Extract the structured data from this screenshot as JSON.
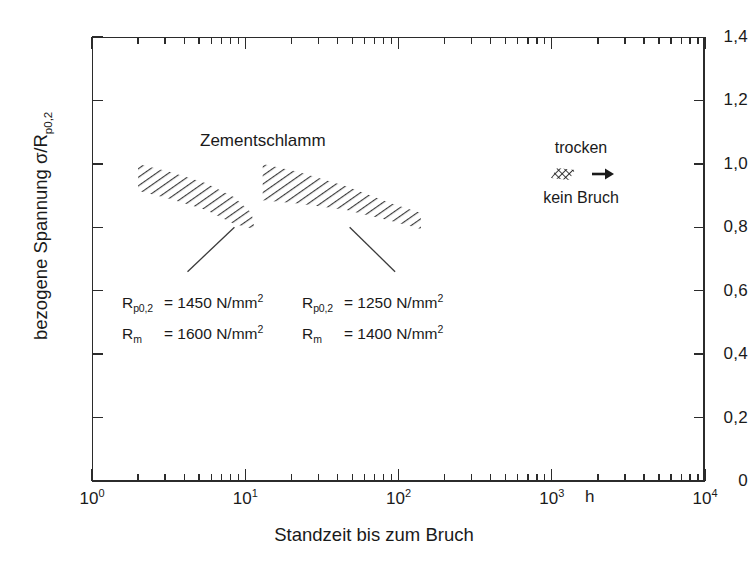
{
  "chart_data": {
    "type": "area",
    "title": "",
    "xlabel": "Standzeit bis zum Bruch",
    "ylabel": "bezogene Spannung σ/Rp0,2",
    "x_unit": "h",
    "x_scale": "log",
    "xlim": [
      1,
      10000
    ],
    "ylim": [
      0,
      1.4
    ],
    "y_scale": "linear",
    "grid": false,
    "x_tick_labels": [
      "10⁰",
      "10¹",
      "10²",
      "10³",
      "10⁴"
    ],
    "x_tick_values": [
      1,
      10,
      100,
      1000,
      10000
    ],
    "y_tick_labels": [
      "0",
      "0,2",
      "0,4",
      "0,6",
      "0,8",
      "1,0",
      "1,2",
      "1,4"
    ],
    "y_tick_values": [
      0,
      0.2,
      0.4,
      0.6,
      0.8,
      1.0,
      1.2,
      1.4
    ],
    "series": [
      {
        "name": "Zementschlamm, Rp0,2 = 1450 N/mm²",
        "type": "scatter-band",
        "upper": [
          [
            2.0,
            1.0
          ],
          [
            3.2,
            0.975
          ],
          [
            5.5,
            0.94
          ],
          [
            8.5,
            0.895
          ],
          [
            11.0,
            0.845
          ]
        ],
        "lower": [
          [
            2.0,
            0.915
          ],
          [
            3.2,
            0.89
          ],
          [
            5.5,
            0.855
          ],
          [
            8.5,
            0.81
          ],
          [
            11.5,
            0.795
          ]
        ]
      },
      {
        "name": "Zementschlamm, Rp0,2 = 1250 N/mm²",
        "type": "scatter-band",
        "upper": [
          [
            13.0,
            1.0
          ],
          [
            22.0,
            0.975
          ],
          [
            45.0,
            0.93
          ],
          [
            90.0,
            0.875
          ],
          [
            140.0,
            0.845
          ]
        ],
        "lower": [
          [
            13.0,
            0.885
          ],
          [
            22.0,
            0.875
          ],
          [
            45.0,
            0.855
          ],
          [
            90.0,
            0.82
          ],
          [
            140.0,
            0.795
          ]
        ]
      }
    ],
    "annotations": [
      {
        "id": "band-1",
        "lines": [
          "Rp0,2 = 1450 N/mm²",
          "Rm = 1600 N/mm²"
        ],
        "leader_from": [
          8.5,
          0.8
        ],
        "leader_to": [
          4.2,
          0.66
        ]
      },
      {
        "id": "band-2",
        "lines": [
          "Rp0,2 = 1250 N/mm²",
          "Rm = 1400 N/mm²"
        ],
        "leader_from": [
          48.0,
          0.8
        ],
        "leader_to": [
          95.0,
          0.66
        ]
      },
      {
        "id": "series-label",
        "lines": [
          "Zementschlamm"
        ]
      },
      {
        "id": "legend",
        "lines": [
          "trocken",
          "kein Bruch"
        ]
      }
    ]
  },
  "axes": {
    "y_title_main": "bezogene Spannung  σ/R",
    "y_title_sub": "p0,2",
    "x_title": "Standzeit bis zum Bruch",
    "x_unit": "h",
    "y_ticks": [
      {
        "label": "1,4",
        "value": 1.4
      },
      {
        "label": "1,2",
        "value": 1.2
      },
      {
        "label": "1,0",
        "value": 1.0
      },
      {
        "label": "0,8",
        "value": 0.8
      },
      {
        "label": "0,6",
        "value": 0.6
      },
      {
        "label": "0,4",
        "value": 0.4
      },
      {
        "label": "0,2",
        "value": 0.2
      },
      {
        "label": "0",
        "value": 0.0
      }
    ],
    "x_ticks": [
      {
        "mantissa": "10",
        "exponent": "0",
        "value": 1
      },
      {
        "mantissa": "10",
        "exponent": "1",
        "value": 10
      },
      {
        "mantissa": "10",
        "exponent": "2",
        "value": 100
      },
      {
        "mantissa": "10",
        "exponent": "3",
        "value": 1000
      },
      {
        "mantissa": "10",
        "exponent": "4",
        "value": 10000
      }
    ]
  },
  "series_label": {
    "text": "Zementschlamm"
  },
  "legend": {
    "top_label": "trocken",
    "bottom_label": "kein Bruch",
    "marker": "hatched-band-swatch",
    "arrow": "right-arrow"
  },
  "annotation_left": {
    "r1_name": "R",
    "r1_sub": "p0,2",
    "r1_eq": "= 1450 N/mm",
    "r1_sup": "2",
    "r2_name": "R",
    "r2_sub": "m",
    "r2_eq": "= 1600 N/mm",
    "r2_sup": "2"
  },
  "annotation_right": {
    "r1_name": "R",
    "r1_sub": "p0,2",
    "r1_eq": "= 1250 N/mm",
    "r1_sup": "2",
    "r2_name": "R",
    "r2_sub": "m",
    "r2_eq": "= 1400 N/mm",
    "r2_sup": "2"
  },
  "colors": {
    "axis": "#2b2b2b",
    "hatch": "#3a3a3a",
    "background": "#ffffff",
    "text": "#1a1a1a"
  }
}
